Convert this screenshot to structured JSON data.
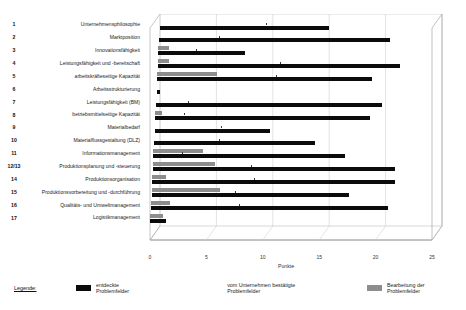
{
  "chart_data": {
    "type": "bar",
    "title": "",
    "xlabel": "Punkte",
    "ylabel": "",
    "xlim": [
      0,
      25
    ],
    "xticks": [
      0,
      5,
      10,
      15,
      20,
      25
    ],
    "grid": true,
    "orientation": "horizontal",
    "legend_position": "bottom",
    "numbers": [
      "1",
      "2",
      "3",
      "4",
      "5",
      "6",
      "7",
      "8",
      "9",
      "10",
      "11",
      "12/13",
      "14",
      "15",
      "16",
      "17"
    ],
    "categories": [
      "Unternehmensphilosophie",
      "Marktposition",
      "Innovationsfähigkeit",
      "Leistungsfähigkeit und -bereitschaft",
      "arbeitskräfteseitige Kapazität",
      "Arbeitsstrukturierung",
      "Leistungsfähigkeit (BM)",
      "betriebsmittelseitige Kapazität",
      "Materialbedarf",
      "Materialflussgestaltung (DLZ)",
      "Informationsmanagement",
      "Produktionsplanung und -steuerung",
      "Produktionsorganisation",
      "Produktionsvorbereitung und -durchführung",
      "Qualitäts- und Umweltmanagement",
      "Logistikmanagement"
    ],
    "series": [
      {
        "name": "entdeckte Problemfelder",
        "color": "#0b0b0b",
        "values": [
          15.0,
          20.5,
          7.7,
          21.5,
          19.0,
          0.3,
          20.0,
          19.0,
          10.2,
          14.3,
          17.0,
          21.5,
          21.5,
          17.5,
          21.0,
          1.4
        ]
      },
      {
        "name": "Bearbeitung der Problemfelder",
        "color": "#8d8d8d",
        "values": [
          0.0,
          0.0,
          0.9,
          1.0,
          5.3,
          0.0,
          0.0,
          0.6,
          0.0,
          0.0,
          4.4,
          5.5,
          1.2,
          6.1,
          1.7,
          1.1
        ]
      }
    ],
    "confirmed_marks": [
      9.4,
      5.3,
      3.3,
      10.8,
      10.5,
      0.0,
      2.8,
      2.5,
      5.9,
      5.8,
      2.5,
      8.7,
      9.0,
      7.4,
      7.8,
      0.0
    ]
  },
  "legend": {
    "title": "Legende:",
    "items": [
      {
        "label": "entdeckte Problemfelder",
        "swatch": "black"
      },
      {
        "label": "vom Unternehmen bestätigte Problemfelder",
        "swatch": "none"
      },
      {
        "label": "Bearbeitung der Problemfelder",
        "swatch": "gray"
      }
    ]
  },
  "axis": {
    "x_title": "Punkte",
    "x_tick_labels": [
      "0",
      "5",
      "10",
      "15",
      "20",
      "25"
    ]
  }
}
